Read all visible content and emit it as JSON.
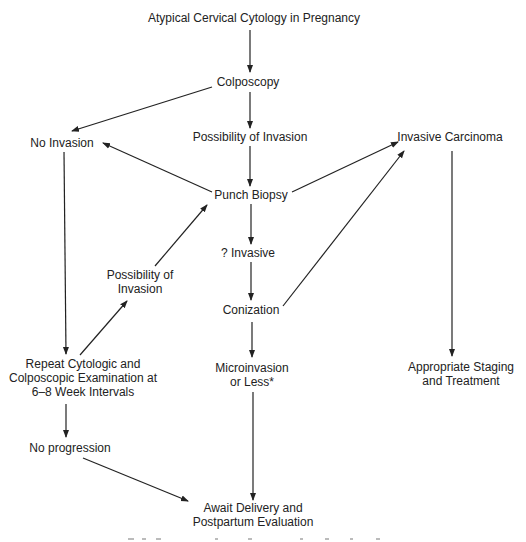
{
  "diagram": {
    "type": "flowchart",
    "nodes": {
      "start": {
        "lines": [
          "Atypical Cervical Cytology in Pregnancy"
        ],
        "x": 254,
        "y": 11
      },
      "colposcopy": {
        "lines": [
          "Colposcopy"
        ],
        "x": 248,
        "y": 75
      },
      "no_invasion": {
        "lines": [
          "No Invasion"
        ],
        "x": 62,
        "y": 136
      },
      "possibility_invasion_center": {
        "lines": [
          "Possibility of Invasion"
        ],
        "x": 250,
        "y": 130
      },
      "invasive_carcinoma": {
        "lines": [
          "Invasive Carcinoma"
        ],
        "x": 450,
        "y": 130
      },
      "punch_biopsy": {
        "lines": [
          "Punch Biopsy"
        ],
        "x": 251,
        "y": 188
      },
      "question_invasive": {
        "lines": [
          "? Invasive"
        ],
        "x": 248,
        "y": 246
      },
      "possibility_invasion_left": {
        "lines": [
          "Possibility of",
          "Invasion"
        ],
        "x": 140,
        "y": 268
      },
      "conization": {
        "lines": [
          "Conization"
        ],
        "x": 251,
        "y": 303
      },
      "repeat_exam": {
        "lines": [
          "Repeat Cytologic and",
          "Colposcopic Examination at",
          "6–8 Week Intervals"
        ],
        "x": 83,
        "y": 357
      },
      "microinvasion": {
        "lines": [
          "Microinvasion",
          "or Less*"
        ],
        "x": 252,
        "y": 361
      },
      "staging_treatment": {
        "lines": [
          "Appropriate Staging",
          "and Treatment"
        ],
        "x": 461,
        "y": 360
      },
      "no_progression": {
        "lines": [
          "No progression"
        ],
        "x": 70,
        "y": 441
      },
      "await_delivery": {
        "lines": [
          "Await Delivery and",
          "Postpartum Evaluation"
        ],
        "x": 253,
        "y": 501
      }
    },
    "edges": [
      {
        "from": "start",
        "to": "colposcopy",
        "x1": 250,
        "y1": 30,
        "x2": 250,
        "y2": 72
      },
      {
        "from": "colposcopy",
        "to": "no_invasion",
        "x1": 212,
        "y1": 87,
        "x2": 72,
        "y2": 131
      },
      {
        "from": "colposcopy",
        "to": "possibility_invasion_center",
        "x1": 250,
        "y1": 92,
        "x2": 250,
        "y2": 128
      },
      {
        "from": "possibility_invasion_center",
        "to": "punch_biopsy",
        "x1": 250,
        "y1": 146,
        "x2": 250,
        "y2": 186
      },
      {
        "from": "punch_biopsy",
        "to": "no_invasion",
        "x1": 212,
        "y1": 192,
        "x2": 103,
        "y2": 143
      },
      {
        "from": "punch_biopsy",
        "to": "invasive_carcinoma",
        "x1": 292,
        "y1": 192,
        "x2": 398,
        "y2": 142
      },
      {
        "from": "punch_biopsy",
        "to": "question_invasive",
        "x1": 251,
        "y1": 204,
        "x2": 251,
        "y2": 244
      },
      {
        "from": "question_invasive",
        "to": "conization",
        "x1": 251,
        "y1": 262,
        "x2": 251,
        "y2": 300
      },
      {
        "from": "conization",
        "to": "invasive_carcinoma",
        "x1": 283,
        "y1": 306,
        "x2": 404,
        "y2": 151
      },
      {
        "from": "possibility_invasion_left",
        "to": "punch_biopsy",
        "x1": 155,
        "y1": 266,
        "x2": 207,
        "y2": 205
      },
      {
        "from": "repeat_exam",
        "to": "possibility_invasion_left",
        "x1": 80,
        "y1": 355,
        "x2": 127,
        "y2": 301
      },
      {
        "from": "no_invasion",
        "to": "repeat_exam",
        "x1": 64,
        "y1": 152,
        "x2": 66,
        "y2": 354
      },
      {
        "from": "conization",
        "to": "microinvasion",
        "x1": 252,
        "y1": 322,
        "x2": 252,
        "y2": 357
      },
      {
        "from": "invasive_carcinoma",
        "to": "staging_treatment",
        "x1": 452,
        "y1": 151,
        "x2": 452,
        "y2": 356
      },
      {
        "from": "repeat_exam",
        "to": "no_progression",
        "x1": 66,
        "y1": 404,
        "x2": 66,
        "y2": 437
      },
      {
        "from": "no_progression",
        "to": "await_delivery",
        "x1": 83,
        "y1": 458,
        "x2": 188,
        "y2": 501
      },
      {
        "from": "microinvasion",
        "to": "await_delivery",
        "x1": 253,
        "y1": 392,
        "x2": 253,
        "y2": 500
      }
    ],
    "colors": {
      "text": "#222222",
      "line": "#222222",
      "background": "#ffffff",
      "cut_text": "#bbbbbb"
    }
  }
}
